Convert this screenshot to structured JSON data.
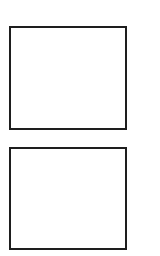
{
  "canvas": {
    "width": 160,
    "height": 256,
    "background": "#ffffff"
  },
  "boxes": [
    {
      "id": "top",
      "label": "",
      "border_color": "#1e1e1e"
    },
    {
      "id": "bottom",
      "label": "",
      "border_color": "#1e1e1e"
    }
  ]
}
